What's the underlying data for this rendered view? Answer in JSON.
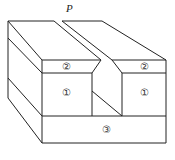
{
  "diagram": {
    "title": "",
    "point_label": "P",
    "layers": [
      {
        "id": "layer-1",
        "label": "①"
      },
      {
        "id": "layer-2",
        "label": "②"
      },
      {
        "id": "layer-3",
        "label": "③"
      }
    ],
    "labels": {
      "left_layer2": "②",
      "right_layer2": "②",
      "left_layer1": "①",
      "right_layer1": "①",
      "base_layer3": "③"
    },
    "colors": {
      "line": "#222222",
      "fill": "#ffffff"
    }
  }
}
